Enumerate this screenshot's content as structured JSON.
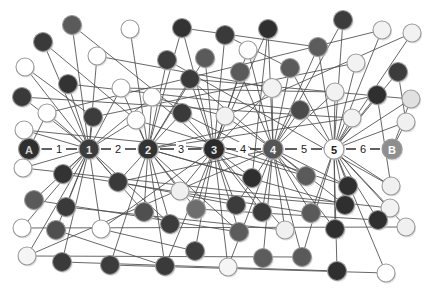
{
  "diagram": {
    "type": "node-link-diagram",
    "width": 426,
    "height": 298,
    "background_color": "#ffffff"
  },
  "palette": {
    "edge": "#4c4c4c",
    "spine_edge": "#3a3a3a",
    "very_dark": "#2f2f2f",
    "dark": "#3c3c3c",
    "mid_dark": "#5a5a5a",
    "mid": "#6e6e6e",
    "light_gray": "#d9d9d9",
    "near_white": "#f2f2f2",
    "white": "#ffffff",
    "stroke": "#9a9a9a",
    "label_dark": "#1b1b1b",
    "label_light": "#f5f5f5"
  },
  "spine": {
    "y": 149,
    "nodes": [
      {
        "id": "A",
        "label": "A",
        "cx": 29,
        "r": 10.5,
        "fill": "#2f2f2f",
        "text_fill": "#cfcfcf",
        "font_size": 11
      },
      {
        "id": "h1",
        "label": "1",
        "cx": 89,
        "r": 10.0,
        "fill": "#3c3c3c",
        "text_fill": "#e8e8e8",
        "font_size": 11
      },
      {
        "id": "h2",
        "label": "2",
        "cx": 148,
        "r": 10.0,
        "fill": "#333333",
        "text_fill": "#e8e8e8",
        "font_size": 11
      },
      {
        "id": "h3",
        "label": "3",
        "cx": 214,
        "r": 10.5,
        "fill": "#2b2b2b",
        "text_fill": "#e8e8e8",
        "font_size": 11
      },
      {
        "id": "h4",
        "label": "4",
        "cx": 273,
        "r": 10.0,
        "fill": "#555555",
        "text_fill": "#f0f0f0",
        "font_size": 11
      },
      {
        "id": "h5",
        "label": "5",
        "cx": 334,
        "r": 10.0,
        "fill": "#ffffff",
        "text_fill": "#1b1b1b",
        "font_size": 11
      },
      {
        "id": "B",
        "label": "B",
        "cx": 392,
        "r": 10.0,
        "fill": "#8e8e8e",
        "text_fill": "#ffffff",
        "font_size": 11
      }
    ],
    "edge_labels": [
      {
        "text": "1",
        "x": 59
      },
      {
        "text": "2",
        "x": 118
      },
      {
        "text": "3",
        "x": 181
      },
      {
        "text": "4",
        "x": 243
      },
      {
        "text": "5",
        "x": 304
      },
      {
        "text": "6",
        "x": 363
      }
    ]
  },
  "scatter_nodes": [
    {
      "cx": 72,
      "cy": 25,
      "r": 9.5,
      "fill": "#5a5a5a"
    },
    {
      "cx": 130,
      "cy": 29,
      "r": 9.0,
      "fill": "#ffffff"
    },
    {
      "cx": 43,
      "cy": 42,
      "r": 9.5,
      "fill": "#3a3a3a"
    },
    {
      "cx": 182,
      "cy": 28,
      "r": 9.5,
      "fill": "#333333"
    },
    {
      "cx": 225,
      "cy": 35,
      "r": 9.5,
      "fill": "#3a3a3a"
    },
    {
      "cx": 268,
      "cy": 29,
      "r": 9.5,
      "fill": "#2f2f2f"
    },
    {
      "cx": 343,
      "cy": 20,
      "r": 9.5,
      "fill": "#3c3c3c"
    },
    {
      "cx": 97,
      "cy": 56,
      "r": 9.0,
      "fill": "#ffffff"
    },
    {
      "cx": 25,
      "cy": 67,
      "r": 9.0,
      "fill": "#ffffff"
    },
    {
      "cx": 167,
      "cy": 60,
      "r": 9.5,
      "fill": "#3c3c3c"
    },
    {
      "cx": 205,
      "cy": 58,
      "r": 9.5,
      "fill": "#5a5a5a"
    },
    {
      "cx": 248,
      "cy": 50,
      "r": 9.0,
      "fill": "#ffffff"
    },
    {
      "cx": 318,
      "cy": 47,
      "r": 9.5,
      "fill": "#5c5c5c"
    },
    {
      "cx": 382,
      "cy": 30,
      "r": 9.0,
      "fill": "#f2f2f2"
    },
    {
      "cx": 412,
      "cy": 33,
      "r": 9.0,
      "fill": "#f2f2f2"
    },
    {
      "cx": 68,
      "cy": 84,
      "r": 9.5,
      "fill": "#333333"
    },
    {
      "cx": 121,
      "cy": 88,
      "r": 9.0,
      "fill": "#ffffff"
    },
    {
      "cx": 190,
      "cy": 79,
      "r": 9.5,
      "fill": "#3a3a3a"
    },
    {
      "cx": 240,
      "cy": 72,
      "r": 9.5,
      "fill": "#5a5a5a"
    },
    {
      "cx": 290,
      "cy": 68,
      "r": 9.5,
      "fill": "#5a5a5a"
    },
    {
      "cx": 356,
      "cy": 63,
      "r": 9.0,
      "fill": "#f2f2f2"
    },
    {
      "cx": 398,
      "cy": 72,
      "r": 9.5,
      "fill": "#3c3c3c"
    },
    {
      "cx": 22,
      "cy": 97,
      "r": 9.5,
      "fill": "#3a3a3a"
    },
    {
      "cx": 152,
      "cy": 97,
      "r": 9.0,
      "fill": "#ffffff"
    },
    {
      "cx": 272,
      "cy": 88,
      "r": 9.5,
      "fill": "#f2f2f2"
    },
    {
      "cx": 335,
      "cy": 92,
      "r": 9.0,
      "fill": "#f2f2f2"
    },
    {
      "cx": 377,
      "cy": 95,
      "r": 9.5,
      "fill": "#2f2f2f"
    },
    {
      "cx": 411,
      "cy": 99,
      "r": 9.0,
      "fill": "#e0e0e0"
    },
    {
      "cx": 47,
      "cy": 113,
      "r": 9.0,
      "fill": "#ffffff"
    },
    {
      "cx": 93,
      "cy": 117,
      "r": 9.5,
      "fill": "#3c3c3c"
    },
    {
      "cx": 136,
      "cy": 120,
      "r": 9.0,
      "fill": "#ffffff"
    },
    {
      "cx": 182,
      "cy": 113,
      "r": 9.5,
      "fill": "#3a3a3a"
    },
    {
      "cx": 225,
      "cy": 116,
      "r": 9.0,
      "fill": "#f2f2f2"
    },
    {
      "cx": 300,
      "cy": 110,
      "r": 9.5,
      "fill": "#4a4a4a"
    },
    {
      "cx": 352,
      "cy": 118,
      "r": 9.0,
      "fill": "#f2f2f2"
    },
    {
      "cx": 406,
      "cy": 122,
      "r": 9.0,
      "fill": "#f0f0f0"
    },
    {
      "cx": 24,
      "cy": 130,
      "r": 9.0,
      "fill": "#ffffff"
    },
    {
      "cx": 23,
      "cy": 168,
      "r": 9.0,
      "fill": "#ffffff"
    },
    {
      "cx": 63,
      "cy": 174,
      "r": 9.5,
      "fill": "#333333"
    },
    {
      "cx": 118,
      "cy": 182,
      "r": 9.5,
      "fill": "#3a3a3a"
    },
    {
      "cx": 180,
      "cy": 191,
      "r": 9.0,
      "fill": "#f0f0f0"
    },
    {
      "cx": 252,
      "cy": 178,
      "r": 9.5,
      "fill": "#2f2f2f"
    },
    {
      "cx": 306,
      "cy": 176,
      "r": 9.5,
      "fill": "#5a5a5a"
    },
    {
      "cx": 348,
      "cy": 186,
      "r": 9.5,
      "fill": "#2f2f2f"
    },
    {
      "cx": 391,
      "cy": 186,
      "r": 9.0,
      "fill": "#f0f0f0"
    },
    {
      "cx": 34,
      "cy": 200,
      "r": 9.5,
      "fill": "#5a5a5a"
    },
    {
      "cx": 66,
      "cy": 207,
      "r": 9.5,
      "fill": "#3a3a3a"
    },
    {
      "cx": 144,
      "cy": 212,
      "r": 9.5,
      "fill": "#4f4f4f"
    },
    {
      "cx": 196,
      "cy": 209,
      "r": 9.5,
      "fill": "#6e6e6e"
    },
    {
      "cx": 236,
      "cy": 205,
      "r": 9.5,
      "fill": "#3c3c3c"
    },
    {
      "cx": 262,
      "cy": 212,
      "r": 9.5,
      "fill": "#3a3a3a"
    },
    {
      "cx": 311,
      "cy": 213,
      "r": 9.5,
      "fill": "#5a5a5a"
    },
    {
      "cx": 345,
      "cy": 205,
      "r": 9.5,
      "fill": "#2f2f2f"
    },
    {
      "cx": 390,
      "cy": 208,
      "r": 9.0,
      "fill": "#f2f2f2"
    },
    {
      "cx": 22,
      "cy": 228,
      "r": 9.0,
      "fill": "#ffffff"
    },
    {
      "cx": 56,
      "cy": 230,
      "r": 9.5,
      "fill": "#4f4f4f"
    },
    {
      "cx": 101,
      "cy": 229,
      "r": 9.0,
      "fill": "#ffffff"
    },
    {
      "cx": 170,
      "cy": 224,
      "r": 9.5,
      "fill": "#3c3c3c"
    },
    {
      "cx": 239,
      "cy": 232,
      "r": 9.5,
      "fill": "#5c5c5c"
    },
    {
      "cx": 285,
      "cy": 230,
      "r": 9.0,
      "fill": "#f0f0f0"
    },
    {
      "cx": 335,
      "cy": 229,
      "r": 9.5,
      "fill": "#2f2f2f"
    },
    {
      "cx": 378,
      "cy": 220,
      "r": 9.5,
      "fill": "#2f2f2f"
    },
    {
      "cx": 406,
      "cy": 227,
      "r": 9.0,
      "fill": "#f0f0f0"
    },
    {
      "cx": 27,
      "cy": 256,
      "r": 9.0,
      "fill": "#f5f5f5"
    },
    {
      "cx": 62,
      "cy": 262,
      "r": 9.5,
      "fill": "#3a3a3a"
    },
    {
      "cx": 110,
      "cy": 265,
      "r": 9.5,
      "fill": "#3c3c3c"
    },
    {
      "cx": 165,
      "cy": 266,
      "r": 9.5,
      "fill": "#3a3a3a"
    },
    {
      "cx": 195,
      "cy": 251,
      "r": 9.5,
      "fill": "#3c3c3c"
    },
    {
      "cx": 228,
      "cy": 267,
      "r": 9.0,
      "fill": "#f5f5f5"
    },
    {
      "cx": 263,
      "cy": 258,
      "r": 9.5,
      "fill": "#5c5c5c"
    },
    {
      "cx": 302,
      "cy": 257,
      "r": 9.5,
      "fill": "#5a5a5a"
    },
    {
      "cx": 337,
      "cy": 271,
      "r": 9.5,
      "fill": "#2f2f2f"
    },
    {
      "cx": 386,
      "cy": 273,
      "r": 9.0,
      "fill": "#ffffff"
    }
  ],
  "spoke_edges": [
    {
      "hub": 1,
      "to": 0
    },
    {
      "hub": 1,
      "to": 2
    },
    {
      "hub": 1,
      "to": 7
    },
    {
      "hub": 1,
      "to": 8
    },
    {
      "hub": 1,
      "to": 15
    },
    {
      "hub": 1,
      "to": 16
    },
    {
      "hub": 1,
      "to": 22
    },
    {
      "hub": 1,
      "to": 23
    },
    {
      "hub": 1,
      "to": 28
    },
    {
      "hub": 1,
      "to": 29
    },
    {
      "hub": 1,
      "to": 30
    },
    {
      "hub": 1,
      "to": 36
    },
    {
      "hub": 1,
      "to": 37
    },
    {
      "hub": 1,
      "to": 38
    },
    {
      "hub": 1,
      "to": 39
    },
    {
      "hub": 1,
      "to": 45
    },
    {
      "hub": 1,
      "to": 46
    },
    {
      "hub": 1,
      "to": 54
    },
    {
      "hub": 1,
      "to": 55
    },
    {
      "hub": 1,
      "to": 56
    },
    {
      "hub": 1,
      "to": 63
    },
    {
      "hub": 1,
      "to": 64
    },
    {
      "hub": 1,
      "to": 47
    },
    {
      "hub": 1,
      "to": 57
    },
    {
      "hub": 2,
      "to": 1
    },
    {
      "hub": 2,
      "to": 3
    },
    {
      "hub": 2,
      "to": 9
    },
    {
      "hub": 2,
      "to": 10
    },
    {
      "hub": 2,
      "to": 16
    },
    {
      "hub": 2,
      "to": 17
    },
    {
      "hub": 2,
      "to": 23
    },
    {
      "hub": 2,
      "to": 30
    },
    {
      "hub": 2,
      "to": 31
    },
    {
      "hub": 2,
      "to": 39
    },
    {
      "hub": 2,
      "to": 40
    },
    {
      "hub": 2,
      "to": 41
    },
    {
      "hub": 2,
      "to": 47
    },
    {
      "hub": 2,
      "to": 48
    },
    {
      "hub": 2,
      "to": 57
    },
    {
      "hub": 2,
      "to": 58
    },
    {
      "hub": 2,
      "to": 65
    },
    {
      "hub": 2,
      "to": 66
    },
    {
      "hub": 2,
      "to": 26
    },
    {
      "hub": 2,
      "to": 52
    },
    {
      "hub": 2,
      "to": 34
    },
    {
      "hub": 3,
      "to": 3
    },
    {
      "hub": 3,
      "to": 4
    },
    {
      "hub": 3,
      "to": 5
    },
    {
      "hub": 3,
      "to": 10
    },
    {
      "hub": 3,
      "to": 11
    },
    {
      "hub": 3,
      "to": 17
    },
    {
      "hub": 3,
      "to": 18
    },
    {
      "hub": 3,
      "to": 23
    },
    {
      "hub": 3,
      "to": 31
    },
    {
      "hub": 3,
      "to": 32
    },
    {
      "hub": 3,
      "to": 40
    },
    {
      "hub": 3,
      "to": 41
    },
    {
      "hub": 3,
      "to": 42
    },
    {
      "hub": 3,
      "to": 48
    },
    {
      "hub": 3,
      "to": 49
    },
    {
      "hub": 3,
      "to": 50
    },
    {
      "hub": 3,
      "to": 58
    },
    {
      "hub": 3,
      "to": 59
    },
    {
      "hub": 3,
      "to": 66
    },
    {
      "hub": 3,
      "to": 67
    },
    {
      "hub": 3,
      "to": 68
    },
    {
      "hub": 3,
      "to": 24
    },
    {
      "hub": 3,
      "to": 36
    },
    {
      "hub": 3,
      "to": 56
    },
    {
      "hub": 4,
      "to": 5
    },
    {
      "hub": 4,
      "to": 6
    },
    {
      "hub": 4,
      "to": 11
    },
    {
      "hub": 4,
      "to": 12
    },
    {
      "hub": 4,
      "to": 18
    },
    {
      "hub": 4,
      "to": 19
    },
    {
      "hub": 4,
      "to": 24
    },
    {
      "hub": 4,
      "to": 25
    },
    {
      "hub": 4,
      "to": 32
    },
    {
      "hub": 4,
      "to": 33
    },
    {
      "hub": 4,
      "to": 42
    },
    {
      "hub": 4,
      "to": 43
    },
    {
      "hub": 4,
      "to": 50
    },
    {
      "hub": 4,
      "to": 51
    },
    {
      "hub": 4,
      "to": 52
    },
    {
      "hub": 4,
      "to": 59
    },
    {
      "hub": 4,
      "to": 60
    },
    {
      "hub": 4,
      "to": 68
    },
    {
      "hub": 4,
      "to": 69
    },
    {
      "hub": 4,
      "to": 70
    },
    {
      "hub": 4,
      "to": 49
    },
    {
      "hub": 4,
      "to": 39
    },
    {
      "hub": 4,
      "to": 63
    },
    {
      "hub": 4,
      "to": 17
    },
    {
      "hub": 5,
      "to": 6
    },
    {
      "hub": 5,
      "to": 12
    },
    {
      "hub": 5,
      "to": 13
    },
    {
      "hub": 5,
      "to": 14
    },
    {
      "hub": 5,
      "to": 19
    },
    {
      "hub": 5,
      "to": 20
    },
    {
      "hub": 5,
      "to": 21
    },
    {
      "hub": 5,
      "to": 25
    },
    {
      "hub": 5,
      "to": 26
    },
    {
      "hub": 5,
      "to": 27
    },
    {
      "hub": 5,
      "to": 33
    },
    {
      "hub": 5,
      "to": 34
    },
    {
      "hub": 5,
      "to": 35
    },
    {
      "hub": 5,
      "to": 43
    },
    {
      "hub": 5,
      "to": 44
    },
    {
      "hub": 5,
      "to": 52
    },
    {
      "hub": 5,
      "to": 53
    },
    {
      "hub": 5,
      "to": 60
    },
    {
      "hub": 5,
      "to": 61
    },
    {
      "hub": 5,
      "to": 62
    },
    {
      "hub": 5,
      "to": 70
    },
    {
      "hub": 5,
      "to": 71
    },
    {
      "hub": 5,
      "to": 72
    },
    {
      "hub": 5,
      "to": 51
    },
    {
      "hub": 0,
      "to": 28
    },
    {
      "hub": 0,
      "to": 36
    },
    {
      "hub": 6,
      "to": 27
    },
    {
      "hub": 6,
      "to": 35
    }
  ],
  "cross_edges": [
    {
      "from": 0,
      "to": 31
    },
    {
      "from": 2,
      "to": 30
    },
    {
      "from": 8,
      "to": 29
    },
    {
      "from": 15,
      "to": 33
    },
    {
      "from": 22,
      "to": 34
    },
    {
      "from": 9,
      "to": 44
    },
    {
      "from": 13,
      "to": 28
    },
    {
      "from": 20,
      "to": 29
    },
    {
      "from": 14,
      "to": 32
    },
    {
      "from": 5,
      "to": 41
    },
    {
      "from": 37,
      "to": 53
    },
    {
      "from": 45,
      "to": 58
    },
    {
      "from": 54,
      "to": 62
    },
    {
      "from": 63,
      "to": 70
    },
    {
      "from": 38,
      "to": 51
    },
    {
      "from": 46,
      "to": 59
    },
    {
      "from": 55,
      "to": 66
    },
    {
      "from": 64,
      "to": 71
    },
    {
      "from": 21,
      "to": 35
    },
    {
      "from": 26,
      "to": 44
    },
    {
      "from": 7,
      "to": 24
    },
    {
      "from": 16,
      "to": 25
    },
    {
      "from": 3,
      "to": 12
    },
    {
      "from": 4,
      "to": 19
    },
    {
      "from": 23,
      "to": 32
    },
    {
      "from": 30,
      "to": 43
    },
    {
      "from": 39,
      "to": 49
    },
    {
      "from": 47,
      "to": 57
    },
    {
      "from": 56,
      "to": 67
    },
    {
      "from": 65,
      "to": 72
    },
    {
      "from": 40,
      "to": 52
    },
    {
      "from": 48,
      "to": 61
    },
    {
      "from": 31,
      "to": 42
    },
    {
      "from": 17,
      "to": 27
    }
  ]
}
